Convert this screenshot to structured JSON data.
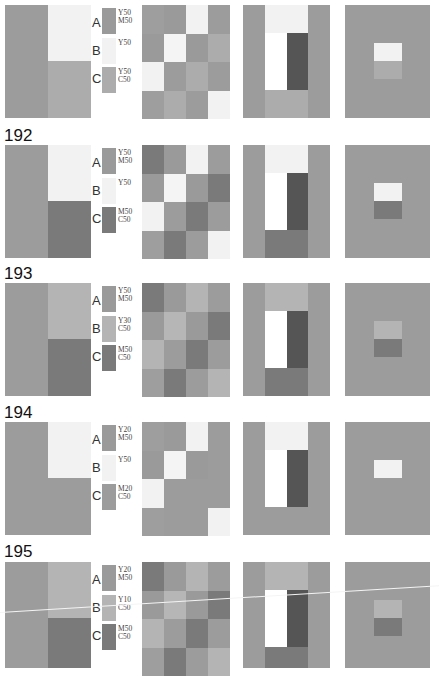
{
  "figure": {
    "panels": [
      {
        "number": "",
        "swatches": [
          {
            "letter": "A",
            "label": "Y50\nM50",
            "color": "#9a9a9a"
          },
          {
            "letter": "B",
            "label": "Y50",
            "color": "#f2f2f2"
          },
          {
            "letter": "C",
            "label": "Y50\nC50",
            "color": "#acacac"
          }
        ],
        "left_block": {
          "bg": "#9c9c9c",
          "top_right": "#f2f2f2",
          "bottom_right": "#acacac"
        },
        "checker": [
          [
            "#9e9e9e",
            "#9a9a9a",
            "#f2f2f2",
            "#9c9c9c"
          ],
          [
            "#9a9a9a",
            "#f4f4f4",
            "#9a9a9a",
            "#acacac"
          ],
          [
            "#f2f2f2",
            "#9c9c9c",
            "#acacac",
            "#9c9c9c"
          ],
          [
            "#9e9e9e",
            "#acacac",
            "#9c9c9c",
            "#f2f2f2"
          ]
        ],
        "ushape": {
          "side": "#9c9c9c",
          "top": "#f2f2f2",
          "white": "#ffffff",
          "dark": "#555555",
          "bottom": "#acacac"
        },
        "center": {
          "bg": "#9c9c9c",
          "top": "#f2f2f2",
          "bottom": "#acacac"
        }
      },
      {
        "number": "192",
        "swatches": [
          {
            "letter": "A",
            "label": "Y50\nM50",
            "color": "#9a9a9a"
          },
          {
            "letter": "B",
            "label": "Y50",
            "color": "#f2f2f2"
          },
          {
            "letter": "C",
            "label": "M50\nC50",
            "color": "#7a7a7a"
          }
        ],
        "left_block": {
          "bg": "#9c9c9c",
          "top_right": "#f2f2f2",
          "bottom_right": "#7a7a7a"
        },
        "checker": [
          [
            "#7a7a7a",
            "#9a9a9a",
            "#f2f2f2",
            "#9c9c9c"
          ],
          [
            "#9a9a9a",
            "#f4f4f4",
            "#9a9a9a",
            "#7a7a7a"
          ],
          [
            "#f2f2f2",
            "#9c9c9c",
            "#7a7a7a",
            "#9c9c9c"
          ],
          [
            "#9e9e9e",
            "#7a7a7a",
            "#9c9c9c",
            "#f2f2f2"
          ]
        ],
        "ushape": {
          "side": "#9c9c9c",
          "top": "#f2f2f2",
          "white": "#ffffff",
          "dark": "#555555",
          "bottom": "#7a7a7a"
        },
        "center": {
          "bg": "#9c9c9c",
          "top": "#f2f2f2",
          "bottom": "#7a7a7a"
        }
      },
      {
        "number": "193",
        "swatches": [
          {
            "letter": "A",
            "label": "Y50\nM50",
            "color": "#9a9a9a"
          },
          {
            "letter": "B",
            "label": "Y30\nC50",
            "color": "#b4b4b4"
          },
          {
            "letter": "C",
            "label": "M50\nC50",
            "color": "#7a7a7a"
          }
        ],
        "left_block": {
          "bg": "#9c9c9c",
          "top_right": "#b4b4b4",
          "bottom_right": "#7a7a7a"
        },
        "checker": [
          [
            "#7a7a7a",
            "#9a9a9a",
            "#b4b4b4",
            "#9c9c9c"
          ],
          [
            "#9a9a9a",
            "#b6b6b6",
            "#9a9a9a",
            "#7a7a7a"
          ],
          [
            "#b4b4b4",
            "#9c9c9c",
            "#7a7a7a",
            "#9c9c9c"
          ],
          [
            "#9e9e9e",
            "#7a7a7a",
            "#9c9c9c",
            "#b4b4b4"
          ]
        ],
        "ushape": {
          "side": "#9c9c9c",
          "top": "#b4b4b4",
          "white": "#ffffff",
          "dark": "#555555",
          "bottom": "#7a7a7a"
        },
        "center": {
          "bg": "#9c9c9c",
          "top": "#b4b4b4",
          "bottom": "#7a7a7a"
        }
      },
      {
        "number": "194",
        "swatches": [
          {
            "letter": "A",
            "label": "Y20\nM50",
            "color": "#9a9a9a"
          },
          {
            "letter": "B",
            "label": "Y50",
            "color": "#f2f2f2"
          },
          {
            "letter": "C",
            "label": "M20\nC50",
            "color": "#9c9c9c"
          }
        ],
        "left_block": {
          "bg": "#9c9c9c",
          "top_right": "#f2f2f2",
          "bottom_right": "#9c9c9c"
        },
        "checker": [
          [
            "#9e9e9e",
            "#9a9a9a",
            "#f2f2f2",
            "#9c9c9c"
          ],
          [
            "#9a9a9a",
            "#f4f4f4",
            "#9a9a9a",
            "#9c9c9c"
          ],
          [
            "#f2f2f2",
            "#9c9c9c",
            "#9c9c9c",
            "#9c9c9c"
          ],
          [
            "#9e9e9e",
            "#9c9c9c",
            "#9c9c9c",
            "#f2f2f2"
          ]
        ],
        "ushape": {
          "side": "#9c9c9c",
          "top": "#f2f2f2",
          "white": "#ffffff",
          "dark": "#555555",
          "bottom": "#9c9c9c"
        },
        "center": {
          "bg": "#9c9c9c",
          "top": "#f2f2f2",
          "bottom": "#9c9c9c"
        }
      },
      {
        "number": "195",
        "swatches": [
          {
            "letter": "A",
            "label": "Y20\nM50",
            "color": "#9a9a9a"
          },
          {
            "letter": "B",
            "label": "Y10\nC50",
            "color": "#b4b4b4"
          },
          {
            "letter": "C",
            "label": "M50\nC50",
            "color": "#7a7a7a"
          }
        ],
        "left_block": {
          "bg": "#9c9c9c",
          "top_right": "#b4b4b4",
          "bottom_right": "#7a7a7a"
        },
        "checker": [
          [
            "#7a7a7a",
            "#9a9a9a",
            "#b4b4b4",
            "#9c9c9c"
          ],
          [
            "#9a9a9a",
            "#b6b6b6",
            "#9a9a9a",
            "#7a7a7a"
          ],
          [
            "#b4b4b4",
            "#9c9c9c",
            "#7a7a7a",
            "#9c9c9c"
          ],
          [
            "#9e9e9e",
            "#7a7a7a",
            "#9c9c9c",
            "#b4b4b4"
          ]
        ],
        "ushape": {
          "side": "#9c9c9c",
          "top": "#b4b4b4",
          "white": "#ffffff",
          "dark": "#555555",
          "bottom": "#7a7a7a"
        },
        "center": {
          "bg": "#9c9c9c",
          "top": "#b4b4b4",
          "bottom": "#7a7a7a"
        }
      }
    ]
  }
}
